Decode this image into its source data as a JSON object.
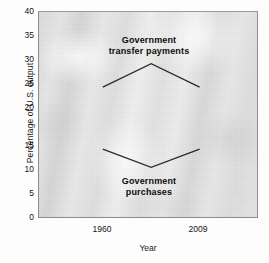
{
  "chart_data": {
    "type": "line",
    "title": "",
    "xlabel": "Year",
    "ylabel": "Percentage of U.S. output",
    "xlim": [
      0,
      100
    ],
    "ylim": [
      0,
      40
    ],
    "grid": false,
    "legend": "none (in-plot annotations)",
    "xtick_labels": [
      "1960",
      "2009"
    ],
    "xtick_positions": [
      29,
      73
    ],
    "ytick_labels": [
      "0",
      "5",
      "10",
      "15",
      "20",
      "25",
      "30",
      "35",
      "40"
    ],
    "ytick_values": [
      0,
      5,
      10,
      15,
      20,
      25,
      30,
      35,
      40
    ],
    "series": [
      {
        "name": "Government transfer payments",
        "color": "#2b2b2b",
        "x": [
          29,
          51,
          73
        ],
        "values": [
          25.5,
          30.0,
          25.5
        ]
      },
      {
        "name": "Government purchases",
        "color": "#2b2b2b",
        "x": [
          29,
          51,
          73
        ],
        "values": [
          13.5,
          10.0,
          13.5
        ]
      }
    ],
    "annotations": [
      {
        "id": "transfer",
        "line1": "Government",
        "line2": "transfer payments"
      },
      {
        "id": "purchases",
        "line1": "Government",
        "line2": "purchases"
      }
    ]
  },
  "figure": {
    "axis_line_color": "#8d8d8d",
    "plot_background": "#e3e3e3",
    "text_color": "#151515"
  }
}
